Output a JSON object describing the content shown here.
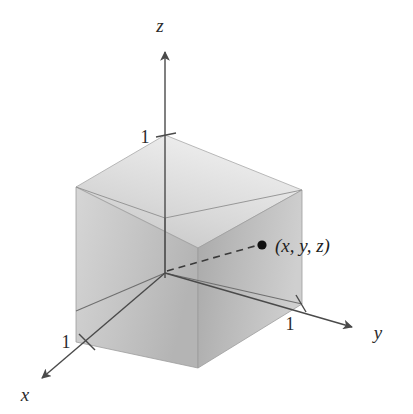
{
  "figure": {
    "kind": "3d-coordinate-system-with-unit-cube",
    "background_color": "#ffffff",
    "line_color": "#4a4a4a",
    "axes": [
      {
        "name": "x",
        "label": "x",
        "direction": "down-left",
        "arrow": true
      },
      {
        "name": "y",
        "label": "y",
        "direction": "right",
        "arrow": true
      },
      {
        "name": "z",
        "label": "z",
        "direction": "up",
        "arrow": true
      }
    ],
    "ticks": [
      {
        "axis": "x",
        "label": "1"
      },
      {
        "axis": "y",
        "label": "1"
      },
      {
        "axis": "z",
        "label": "1"
      }
    ],
    "point": {
      "label": "(x, y, z)",
      "marker": "filled-dot",
      "marker_color": "#111111",
      "connector": "dashed-line-from-origin"
    },
    "cube": {
      "description": "shaded unit cube",
      "faces": [
        {
          "name": "top-face",
          "shade": "#dcdcdc"
        },
        {
          "name": "left-face",
          "shade": "#c9c9c9"
        },
        {
          "name": "right-face",
          "shade": "#bdbdbd"
        }
      ],
      "edge_color": "#8a8a8a"
    }
  }
}
